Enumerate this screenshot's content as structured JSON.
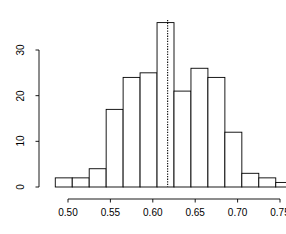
{
  "chart_data": {
    "type": "bar",
    "title": "",
    "subtitle": "",
    "xlabel": "",
    "ylabel": "",
    "style": "r-histogram",
    "grid": false,
    "legend": null,
    "legend_position": "none",
    "bar_fill": "#ffffff",
    "bar_stroke": "#000000",
    "axis_color": "#000000",
    "binwidth": 0.02,
    "xlim": [
      0.485,
      0.765
    ],
    "ylim": [
      0,
      36
    ],
    "xticks": [
      0.5,
      0.55,
      0.6,
      0.65,
      0.7,
      0.75
    ],
    "xtick_labels": [
      "0.50",
      "0.55",
      "0.60",
      "0.65",
      "0.70",
      "0.75"
    ],
    "yticks": [
      0,
      10,
      20,
      30
    ],
    "ytick_labels": [
      "0",
      "10",
      "20",
      "30"
    ],
    "bins": [
      {
        "x0": 0.485,
        "x1": 0.505,
        "value": 2
      },
      {
        "x0": 0.505,
        "x1": 0.525,
        "value": 2
      },
      {
        "x0": 0.525,
        "x1": 0.545,
        "value": 4
      },
      {
        "x0": 0.545,
        "x1": 0.565,
        "value": 17
      },
      {
        "x0": 0.565,
        "x1": 0.585,
        "value": 24
      },
      {
        "x0": 0.585,
        "x1": 0.605,
        "value": 25
      },
      {
        "x0": 0.605,
        "x1": 0.625,
        "value": 36
      },
      {
        "x0": 0.625,
        "x1": 0.645,
        "value": 21
      },
      {
        "x0": 0.645,
        "x1": 0.665,
        "value": 26
      },
      {
        "x0": 0.665,
        "x1": 0.685,
        "value": 24
      },
      {
        "x0": 0.685,
        "x1": 0.705,
        "value": 12
      },
      {
        "x0": 0.705,
        "x1": 0.725,
        "value": 3
      },
      {
        "x0": 0.725,
        "x1": 0.745,
        "value": 2
      },
      {
        "x0": 0.745,
        "x1": 0.765,
        "value": 1
      }
    ],
    "categories": [
      "0.485-0.505",
      "0.505-0.525",
      "0.525-0.545",
      "0.545-0.565",
      "0.565-0.585",
      "0.585-0.605",
      "0.605-0.625",
      "0.625-0.645",
      "0.645-0.665",
      "0.665-0.685",
      "0.685-0.705",
      "0.705-0.725",
      "0.725-0.745",
      "0.745-0.765"
    ],
    "values": [
      2,
      2,
      4,
      17,
      24,
      25,
      36,
      21,
      26,
      24,
      12,
      3,
      2,
      1
    ],
    "annotations": [
      {
        "type": "vline",
        "x": 0.6175,
        "linestyle": "dotted",
        "color": "#000000",
        "label": ""
      }
    ]
  }
}
